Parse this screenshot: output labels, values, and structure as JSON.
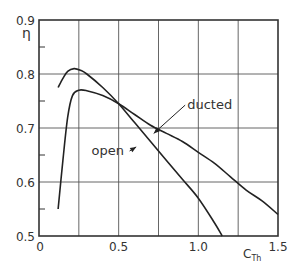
{
  "chart_data": {
    "type": "line",
    "title": "",
    "xlabel": "C_Th",
    "ylabel": "η",
    "xlim": [
      0,
      1.5
    ],
    "ylim": [
      0.5,
      0.9
    ],
    "grid": true,
    "x_ticks": [
      "0",
      "0.5",
      "1.0",
      "1.5"
    ],
    "y_ticks": [
      "0.5",
      "0.6",
      "0.7",
      "0.8",
      "0.9"
    ],
    "x_gridlines": [
      0.25,
      0.5,
      0.75,
      1.0,
      1.25
    ],
    "y_gridlines": [
      0.6,
      0.7,
      0.8
    ],
    "y_minor_ticks": [
      0.55,
      0.65,
      0.75,
      0.85
    ],
    "series": [
      {
        "name": "open",
        "x": [
          0.12,
          0.15,
          0.18,
          0.22,
          0.26,
          0.3,
          0.4,
          0.5,
          0.6,
          0.7,
          0.8,
          0.9,
          1.0,
          1.1,
          1.15
        ],
        "y": [
          0.775,
          0.792,
          0.805,
          0.81,
          0.807,
          0.8,
          0.775,
          0.745,
          0.71,
          0.675,
          0.64,
          0.605,
          0.57,
          0.525,
          0.5
        ]
      },
      {
        "name": "ducted",
        "x": [
          0.12,
          0.15,
          0.18,
          0.21,
          0.25,
          0.3,
          0.4,
          0.5,
          0.6,
          0.7,
          0.8,
          0.9,
          1.0,
          1.1,
          1.2,
          1.3,
          1.4,
          1.5
        ],
        "y": [
          0.55,
          0.64,
          0.72,
          0.76,
          0.77,
          0.769,
          0.76,
          0.745,
          0.725,
          0.705,
          0.69,
          0.675,
          0.655,
          0.635,
          0.61,
          0.585,
          0.565,
          0.54
        ]
      }
    ],
    "annotations": [
      {
        "text": "ducted",
        "x": 0.93,
        "y": 0.735,
        "arrow_to": [
          0.72,
          0.69
        ]
      },
      {
        "text": "open",
        "x": 0.33,
        "y": 0.65,
        "arrow_to": [
          0.61,
          0.665
        ]
      }
    ]
  },
  "labels": {
    "y_axis": "η",
    "x_axis_main": "C",
    "x_axis_sub": "Th",
    "open": "open",
    "ducted": "ducted"
  }
}
